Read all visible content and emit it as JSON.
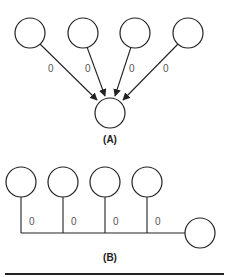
{
  "diagram_a": {
    "caption": "(A)",
    "source_nodes": [
      {
        "cx": 30,
        "cy": 33
      },
      {
        "cx": 83,
        "cy": 33
      },
      {
        "cx": 135,
        "cy": 33
      },
      {
        "cx": 188,
        "cy": 33
      }
    ],
    "target_node": {
      "cx": 110,
      "cy": 112
    },
    "edge_labels": [
      "0",
      "0",
      "0",
      "0"
    ]
  },
  "diagram_b": {
    "caption": "(B)",
    "source_nodes": [
      {
        "cx": 21,
        "cy": 182
      },
      {
        "cx": 63,
        "cy": 182
      },
      {
        "cx": 105,
        "cy": 182
      },
      {
        "cx": 147,
        "cy": 182
      }
    ],
    "target_node": {
      "cx": 200,
      "cy": 233
    },
    "edge_labels": [
      "0",
      "0",
      "0",
      "0"
    ]
  },
  "colors": {
    "stroke": "#222222",
    "label": "#555555",
    "background": "#ffffff"
  }
}
